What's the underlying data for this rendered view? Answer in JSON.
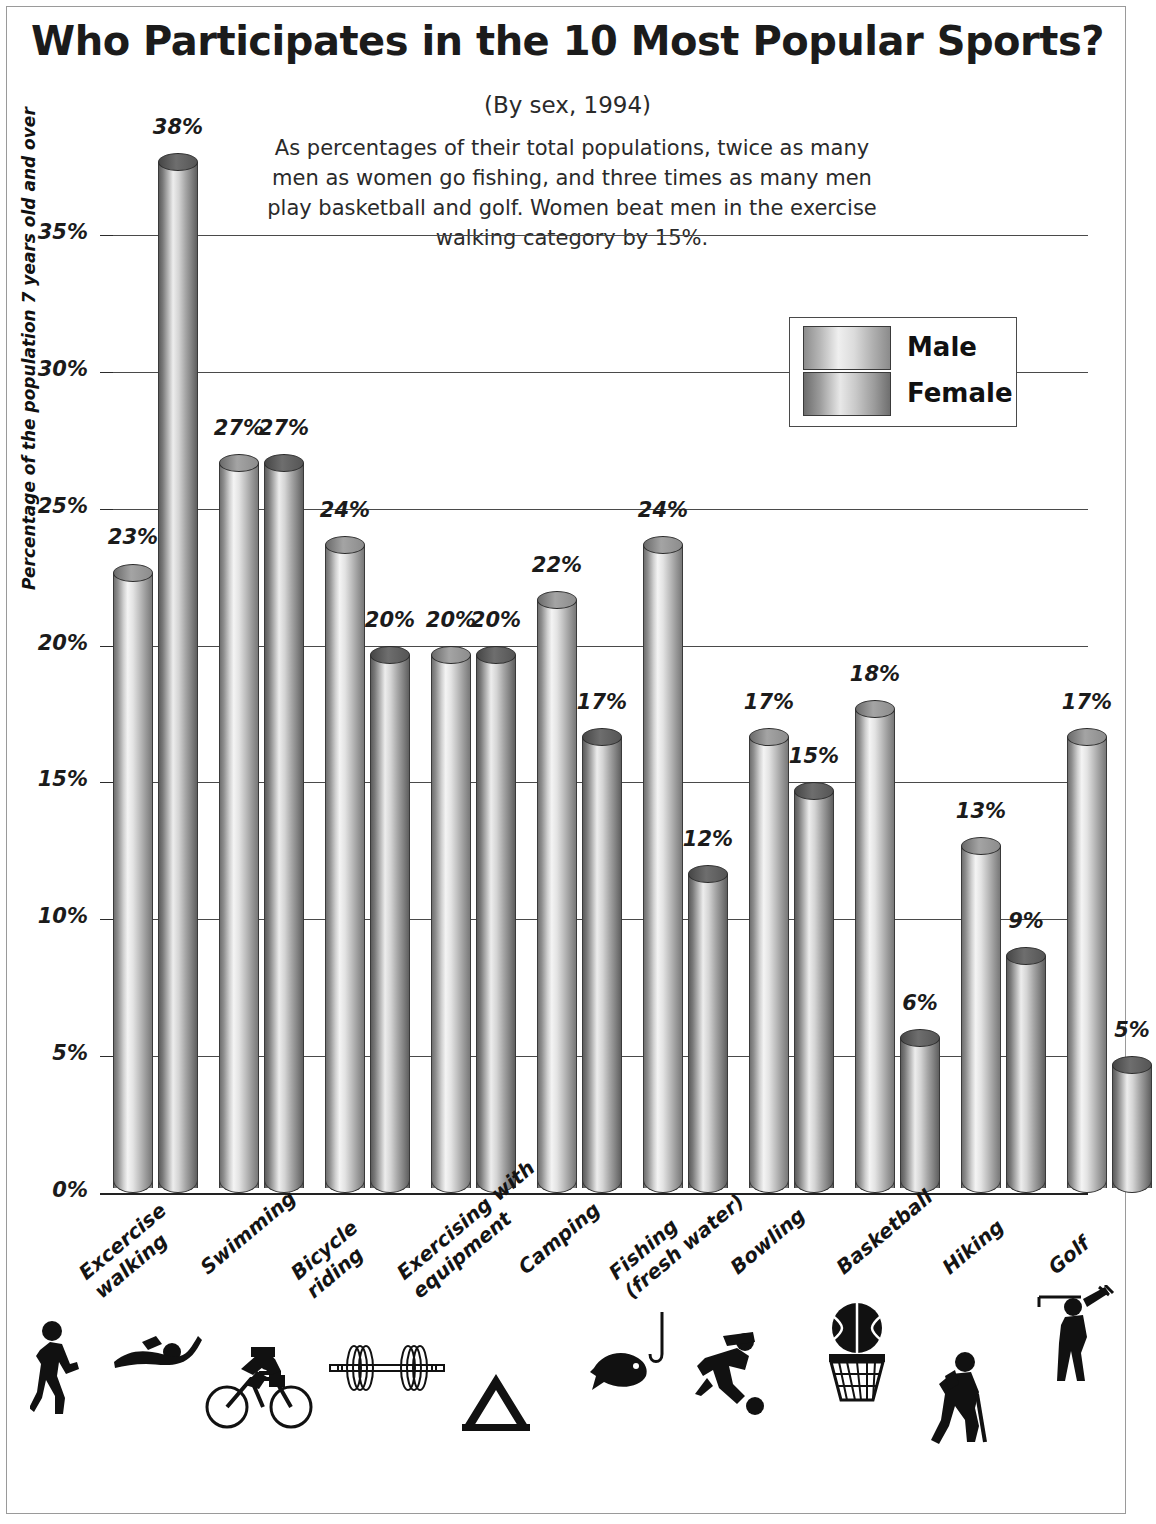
{
  "title": "Who Participates in the 10 Most Popular Sports?",
  "subtitle": "(By sex, 1994)",
  "blurb": "As percentages of their total populations, twice as many men as women go fishing, and three times as many men play basketball and golf.  Women beat men in the exercise walking category by 15%.",
  "legend": {
    "items": [
      {
        "label": "Male",
        "key": "male"
      },
      {
        "label": "Female",
        "key": "female"
      }
    ]
  },
  "axis": {
    "y_title": "Percentage of the population 7 years old and over",
    "y_ticks": [
      "0%",
      "5%",
      "10%",
      "15%",
      "20%",
      "25%",
      "30%",
      "35%"
    ]
  },
  "chart_data": {
    "type": "bar",
    "title": "Who Participates in the 10 Most Popular Sports?",
    "subtitle": "(By sex, 1994)",
    "xlabel": "",
    "ylabel": "Percentage of the population 7 years old and over",
    "ylim": [
      0,
      38
    ],
    "ytick_values": [
      0,
      5,
      10,
      15,
      20,
      25,
      30,
      35
    ],
    "grid": true,
    "legend_position": "top-right",
    "categories": [
      "Excercise walking",
      "Swimming",
      "Bicycle riding",
      "Exercising with equipment",
      "Camping",
      "Fishing (fresh water)",
      "Bowling",
      "Basketball",
      "Hiking",
      "Golf"
    ],
    "category_lines": [
      [
        "Excercise",
        "walking"
      ],
      [
        "Swimming",
        ""
      ],
      [
        "Bicycle",
        "riding"
      ],
      [
        "Exercising with",
        "equipment"
      ],
      [
        "Camping",
        ""
      ],
      [
        "Fishing",
        "(fresh water)"
      ],
      [
        "Bowling",
        ""
      ],
      [
        "Basketball",
        ""
      ],
      [
        "Hiking",
        ""
      ],
      [
        "Golf",
        ""
      ]
    ],
    "category_icons": [
      "walking-icon",
      "swimmer-icon",
      "bicycle-icon",
      "barbell-icon",
      "tent-icon",
      "fish-hook-icon",
      "bowler-icon",
      "basketball-hoop-icon",
      "hiker-icon",
      "golfer-icon"
    ],
    "series": [
      {
        "name": "Male",
        "values": [
          23,
          27,
          24,
          20,
          22,
          24,
          17,
          18,
          13,
          17
        ]
      },
      {
        "name": "Female",
        "values": [
          38,
          27,
          20,
          20,
          17,
          12,
          15,
          6,
          9,
          5
        ]
      }
    ],
    "data_labels": [
      [
        "23%",
        "38%"
      ],
      [
        "27%",
        "27%"
      ],
      [
        "24%",
        "20%"
      ],
      [
        "20%",
        "20%"
      ],
      [
        "22%",
        "17%"
      ],
      [
        "24%",
        "12%"
      ],
      [
        "17%",
        "15%"
      ],
      [
        "18%",
        "6%"
      ],
      [
        "13%",
        "9%"
      ],
      [
        "17%",
        "5%"
      ]
    ]
  },
  "colors": {
    "male_light": "#f4f4f4",
    "male_dark": "#6f6f6f",
    "female_light": "#ededed",
    "female_dark": "#5c5c5c",
    "gridline": "#4a4a4a",
    "text": "#1b1b1b"
  }
}
